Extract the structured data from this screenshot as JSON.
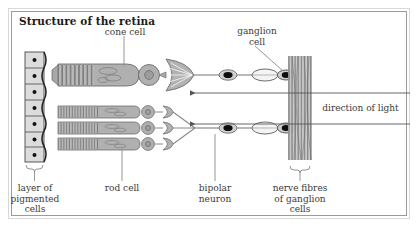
{
  "figure": {
    "title": "Structure of the retina",
    "border_color": "#9a9a9a",
    "background": "#ffffff",
    "width": 419,
    "height": 235
  },
  "labels": {
    "cone_cell": "cone cell",
    "ganglion_cell_line1": "ganglion",
    "ganglion_cell_line2": "cell",
    "direction_of_light": "direction of light",
    "pigmented_line1": "layer of",
    "pigmented_line2": "pigmented",
    "pigmented_line3": "cells",
    "rod_cell": "rod cell",
    "bipolar_line1": "bipolar",
    "bipolar_line2": "neuron",
    "nerve_line1": "nerve fibres",
    "nerve_line2": "of ganglion",
    "nerve_line3": "cells"
  },
  "diagram": {
    "type": "biological-schematic",
    "cell_fill": "#b0b0b0",
    "cell_stroke": "#6e6e6e",
    "nucleus_fill": "#0d0d0d",
    "pigment_fill": "#dcdcdc",
    "pigment_stroke": "#4a4a4a",
    "fibre_color": "#8c8c8c",
    "leader_color": "#8a8a8a",
    "arrow_color": "#555555",
    "structures": [
      {
        "name": "layer-of-pigmented-cells",
        "count": 7,
        "x": 34,
        "y_top": 52,
        "y_bottom": 162
      },
      {
        "name": "cone-cell",
        "count": 1,
        "y": 75
      },
      {
        "name": "rod-cell",
        "count": 3,
        "y": [
          112,
          128,
          144
        ]
      },
      {
        "name": "bipolar-neuron",
        "count": 2,
        "y": [
          75,
          128
        ]
      },
      {
        "name": "ganglion-cell",
        "count": 2,
        "y": [
          75,
          128
        ]
      },
      {
        "name": "nerve-fibre-bundle",
        "x": 288,
        "y_top": 56,
        "y_bottom": 160
      }
    ],
    "light_arrows": [
      {
        "y": 93,
        "from_x": 410,
        "to_x": 188,
        "direction": "left"
      },
      {
        "y": 124,
        "from_x": 410,
        "to_x": 188,
        "direction": "left"
      }
    ]
  }
}
